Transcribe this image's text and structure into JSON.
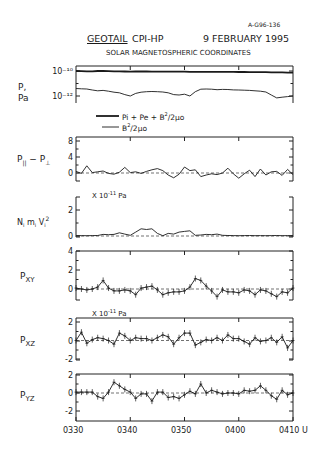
{
  "figure_id": "A-G96-136",
  "header": {
    "mission": "GEOTAIL",
    "instrument": "CPI-HP",
    "date": "9 FEBRUARY 1995",
    "subtitle": "SOLAR MAGNETOSPHERIC COORDINATES"
  },
  "x_axis": {
    "tick_labels": [
      "0330",
      "0340",
      "0350",
      "0400",
      "0410"
    ],
    "unit_suffix": "U"
  },
  "chart_data": [
    {
      "type": "line",
      "id": "pressure",
      "ylabel": "P, Pa",
      "yscale": "log",
      "tick_labels": [
        "10^-10",
        "10^-12"
      ],
      "ylim": [
        3e-13,
        2e-10
      ],
      "legend": [
        "Pi + Pe + B²/2μo",
        "B²/2μo"
      ],
      "legend_position": "below",
      "x": [
        0,
        1,
        2,
        3,
        4,
        5,
        6,
        7,
        8,
        9,
        10,
        11,
        12,
        13,
        14,
        15,
        16,
        17,
        18,
        19,
        20,
        21,
        22,
        23,
        24,
        25,
        26,
        27,
        28,
        29,
        30,
        31,
        32,
        33,
        34,
        35,
        36,
        37,
        38,
        39,
        40
      ],
      "series": [
        {
          "name": "Pi + Pe + B²/2μo",
          "values": [
            1e-10,
            9.6e-11,
            9.4e-11,
            9.5e-11,
            1e-10,
            1e-10,
            9.8e-11,
            9.5e-11,
            9.3e-11,
            9.2e-11,
            9e-11,
            9.1e-11,
            9.2e-11,
            9.2e-11,
            9e-11,
            8.9e-11,
            8.8e-11,
            8.8e-11,
            8.9e-11,
            8.9e-11,
            8.8e-11,
            8.7e-11,
            8.7e-11,
            8.6e-11,
            8.6e-11,
            8.7e-11,
            8.6e-11,
            8.5e-11,
            8.5e-11,
            8.4e-11,
            8.3e-11,
            8.3e-11,
            8.2e-11,
            8.1e-11,
            8e-11,
            8e-11,
            7.9e-11,
            7.8e-11,
            7.7e-11,
            7.5e-11,
            7.3e-11
          ]
        },
        {
          "name": "B²/2μo",
          "values": [
            4e-12,
            3.8e-12,
            3.6e-12,
            3e-12,
            2.6e-12,
            2.8e-12,
            2.4e-12,
            2e-12,
            1.8e-12,
            1.3e-12,
            1e-12,
            1.6e-12,
            2e-12,
            2.2e-12,
            2.3e-12,
            2.2e-12,
            2.1e-12,
            1.8e-12,
            1.3e-12,
            1.2e-12,
            1.4e-12,
            1e-12,
            2.2e-12,
            3.5e-12,
            3.6e-12,
            3.5e-12,
            3.2e-12,
            3.4e-12,
            3.3e-12,
            3.1e-12,
            3e-12,
            2.9e-12,
            2.8e-12,
            2.6e-12,
            2.4e-12,
            2.1e-12,
            1.2e-12,
            7e-13,
            8e-13,
            9e-13,
            1e-12
          ]
        }
      ]
    },
    {
      "type": "line",
      "id": "anisotropy",
      "ylabel": "P∥ − P⊥",
      "tick_labels": [
        "8",
        "4",
        "0"
      ],
      "ylim": [
        -1.5,
        9
      ],
      "x": [
        0,
        1,
        2,
        3,
        4,
        5,
        6,
        7,
        8,
        9,
        10,
        11,
        12,
        13,
        14,
        15,
        16,
        17,
        18,
        19,
        20,
        21,
        22,
        23,
        24,
        25,
        26,
        27,
        28,
        29,
        30,
        31,
        32,
        33,
        34,
        35,
        36,
        37,
        38,
        39,
        40
      ],
      "series": [
        {
          "name": "P∥ − P⊥",
          "values": [
            0.4,
            -0.1,
            1.8,
            0.1,
            0.3,
            0.5,
            -0.1,
            -0.3,
            0.2,
            1.4,
            0.1,
            0.3,
            -0.1,
            0.4,
            0.8,
            1.1,
            0.6,
            -0.5,
            -1.2,
            -0.3,
            1.5,
            0.6,
            0.8,
            -0.9,
            -0.5,
            -0.2,
            -0.4,
            0.0,
            1.2,
            -0.2,
            -1.3,
            -0.2,
            0.7,
            -0.9,
            1.0,
            -0.5,
            0.3,
            0.4,
            -0.6,
            0.9,
            -0.4
          ]
        }
      ],
      "reference_line": 0
    },
    {
      "type": "line",
      "id": "dynamic-pressure",
      "ylabel": "Ni mi Vi²",
      "unit_label": "X 10^-11 Pa",
      "tick_labels": [
        "2",
        "0"
      ],
      "ylim": [
        0,
        3
      ],
      "x": [
        0,
        1,
        2,
        3,
        4,
        5,
        6,
        7,
        8,
        9,
        10,
        11,
        12,
        13,
        14,
        15,
        16,
        17,
        18,
        19,
        20,
        21,
        22,
        23,
        24,
        25,
        26,
        27,
        28,
        29,
        30,
        31,
        32,
        33,
        34,
        35,
        36,
        37,
        38,
        39,
        40
      ],
      "series": [
        {
          "name": "Ni mi Vi²",
          "values": [
            0.02,
            0.03,
            0.02,
            0.03,
            0.04,
            0.12,
            0.1,
            0.12,
            0.25,
            0.15,
            0.05,
            0.3,
            0.55,
            0.5,
            0.55,
            0.2,
            0.02,
            0.2,
            0.15,
            0.3,
            0.35,
            0.4,
            0.05,
            0.08,
            0.12,
            0.1,
            0.15,
            0.05,
            0.04,
            0.03,
            0.02,
            0.03,
            0.04,
            0.02,
            0.03,
            0.02,
            0.03,
            0.04,
            0.02,
            0.03,
            0.02
          ]
        }
      ],
      "reference_line": 0
    },
    {
      "type": "line",
      "id": "pxy",
      "ylabel": "PXY",
      "tick_labels": [
        "4",
        "2",
        "0"
      ],
      "ylim": [
        -1.2,
        4
      ],
      "error_bars": true,
      "x": [
        0,
        1,
        2,
        3,
        4,
        5,
        6,
        7,
        8,
        9,
        10,
        11,
        12,
        13,
        14,
        15,
        16,
        17,
        18,
        19,
        20,
        21,
        22,
        23,
        24,
        25,
        26,
        27,
        28,
        29,
        30,
        31,
        32,
        33,
        34,
        35,
        36,
        37,
        38,
        39,
        40
      ],
      "series": [
        {
          "name": "PXY",
          "values": [
            0.1,
            0.0,
            -0.1,
            0.0,
            0.2,
            0.9,
            0.1,
            -0.2,
            -0.2,
            -0.1,
            -0.2,
            -0.6,
            0.1,
            0.2,
            0.3,
            -0.1,
            -0.6,
            -0.4,
            -0.3,
            -0.3,
            -0.2,
            0.2,
            1.1,
            0.9,
            0.3,
            -0.2,
            -0.8,
            -0.1,
            -0.3,
            -0.3,
            -0.4,
            -0.1,
            -0.2,
            -0.6,
            -0.1,
            -0.2,
            -0.5,
            -0.8,
            -0.3,
            -0.4,
            0.1
          ]
        }
      ],
      "reference_line": 0
    },
    {
      "type": "line",
      "id": "pxz",
      "ylabel": "PXZ",
      "unit_label": "X 10^-11 Pa",
      "tick_labels": [
        "2",
        "0",
        "-2"
      ],
      "ylim": [
        -2,
        2
      ],
      "error_bars": true,
      "x": [
        0,
        1,
        2,
        3,
        4,
        5,
        6,
        7,
        8,
        9,
        10,
        11,
        12,
        13,
        14,
        15,
        16,
        17,
        18,
        19,
        20,
        21,
        22,
        23,
        24,
        25,
        26,
        27,
        28,
        29,
        30,
        31,
        32,
        33,
        34,
        35,
        36,
        37,
        38,
        39,
        40
      ],
      "series": [
        {
          "name": "PXZ",
          "values": [
            0.0,
            0.9,
            -0.3,
            0.1,
            0.3,
            0.2,
            0.0,
            -0.4,
            0.8,
            0.5,
            0.0,
            0.3,
            0.2,
            0.2,
            0.0,
            0.3,
            0.6,
            0.4,
            -0.4,
            0.3,
            0.8,
            0.8,
            -0.5,
            -0.2,
            0.1,
            0.0,
            0.3,
            0.0,
            0.6,
            0.2,
            0.2,
            -0.1,
            -0.4,
            0.3,
            -0.1,
            0.0,
            0.3,
            -0.2,
            0.4,
            -0.8,
            0.0
          ]
        }
      ],
      "reference_line": 0
    },
    {
      "type": "line",
      "id": "pyz",
      "ylabel": "PYZ",
      "tick_labels": [
        "2",
        "0",
        "-2"
      ],
      "ylim": [
        -2.8,
        2
      ],
      "error_bars": true,
      "x": [
        0,
        1,
        2,
        3,
        4,
        5,
        6,
        7,
        8,
        9,
        10,
        11,
        12,
        13,
        14,
        15,
        16,
        17,
        18,
        19,
        20,
        21,
        22,
        23,
        24,
        25,
        26,
        27,
        28,
        29,
        30,
        31,
        32,
        33,
        34,
        35,
        36,
        37,
        38,
        39,
        40
      ],
      "series": [
        {
          "name": "PYZ",
          "values": [
            0.1,
            0.1,
            0.1,
            0.1,
            -0.4,
            -0.6,
            0.1,
            1.2,
            0.8,
            0.4,
            0.1,
            -0.6,
            -0.1,
            -0.1,
            -0.9,
            0.1,
            0.1,
            -0.5,
            -0.4,
            -0.6,
            -0.2,
            0.2,
            -0.1,
            1.0,
            0.0,
            0.3,
            0.1,
            -0.1,
            0.0,
            0.0,
            -0.1,
            0.3,
            0.2,
            0.3,
            0.8,
            0.3,
            -0.3,
            -0.7,
            0.3,
            -0.2,
            0.0
          ]
        }
      ],
      "reference_line": 0
    }
  ]
}
